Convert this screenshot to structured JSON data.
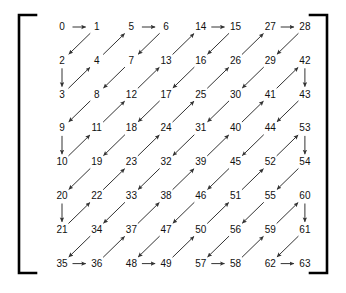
{
  "figure": {
    "type": "zigzag-scan-order-diagram",
    "grid_rows": 8,
    "grid_cols": 8,
    "bracket_color": "#000000",
    "arrow_color": "#333333",
    "text_color": "#111111",
    "background_color": "#ffffff"
  },
  "chart_data": {
    "type": "table",
    "title": "",
    "xlabel": "",
    "ylabel": "",
    "grid": false,
    "legend": "none",
    "rows": [
      [
        0,
        1,
        5,
        6,
        14,
        15,
        27,
        28
      ],
      [
        2,
        4,
        7,
        13,
        16,
        26,
        29,
        42
      ],
      [
        3,
        8,
        12,
        17,
        25,
        30,
        41,
        43
      ],
      [
        9,
        11,
        18,
        24,
        31,
        40,
        44,
        53
      ],
      [
        10,
        19,
        23,
        32,
        39,
        45,
        52,
        54
      ],
      [
        20,
        22,
        33,
        38,
        46,
        51,
        55,
        60
      ],
      [
        21,
        34,
        37,
        47,
        50,
        56,
        59,
        61
      ],
      [
        35,
        36,
        48,
        49,
        57,
        58,
        62,
        63
      ]
    ],
    "sequence": [
      [
        0,
        0
      ],
      [
        0,
        1
      ],
      [
        1,
        0
      ],
      [
        2,
        0
      ],
      [
        1,
        1
      ],
      [
        0,
        2
      ],
      [
        0,
        3
      ],
      [
        1,
        2
      ],
      [
        2,
        1
      ],
      [
        3,
        0
      ],
      [
        4,
        0
      ],
      [
        3,
        1
      ],
      [
        2,
        2
      ],
      [
        1,
        3
      ],
      [
        0,
        4
      ],
      [
        0,
        5
      ],
      [
        1,
        4
      ],
      [
        2,
        3
      ],
      [
        3,
        2
      ],
      [
        4,
        1
      ],
      [
        5,
        0
      ],
      [
        6,
        0
      ],
      [
        5,
        1
      ],
      [
        4,
        2
      ],
      [
        3,
        3
      ],
      [
        2,
        4
      ],
      [
        1,
        5
      ],
      [
        0,
        6
      ],
      [
        0,
        7
      ],
      [
        1,
        6
      ],
      [
        2,
        5
      ],
      [
        3,
        4
      ],
      [
        4,
        3
      ],
      [
        5,
        2
      ],
      [
        6,
        1
      ],
      [
        7,
        0
      ],
      [
        7,
        1
      ],
      [
        6,
        2
      ],
      [
        5,
        3
      ],
      [
        4,
        4
      ],
      [
        3,
        5
      ],
      [
        2,
        6
      ],
      [
        1,
        7
      ],
      [
        2,
        7
      ],
      [
        3,
        6
      ],
      [
        4,
        5
      ],
      [
        5,
        4
      ],
      [
        6,
        3
      ],
      [
        7,
        2
      ],
      [
        7,
        3
      ],
      [
        6,
        4
      ],
      [
        5,
        5
      ],
      [
        4,
        6
      ],
      [
        3,
        7
      ],
      [
        4,
        7
      ],
      [
        5,
        6
      ],
      [
        6,
        5
      ],
      [
        7,
        4
      ],
      [
        7,
        5
      ],
      [
        6,
        6
      ],
      [
        5,
        7
      ],
      [
        6,
        7
      ],
      [
        7,
        6
      ],
      [
        7,
        7
      ]
    ]
  },
  "cells": [
    {
      "value": "0",
      "row": 0,
      "col": 0
    },
    {
      "value": "1",
      "row": 0,
      "col": 1
    },
    {
      "value": "5",
      "row": 0,
      "col": 2
    },
    {
      "value": "6",
      "row": 0,
      "col": 3
    },
    {
      "value": "14",
      "row": 0,
      "col": 4
    },
    {
      "value": "15",
      "row": 0,
      "col": 5
    },
    {
      "value": "27",
      "row": 0,
      "col": 6
    },
    {
      "value": "28",
      "row": 0,
      "col": 7
    },
    {
      "value": "2",
      "row": 1,
      "col": 0
    },
    {
      "value": "4",
      "row": 1,
      "col": 1
    },
    {
      "value": "7",
      "row": 1,
      "col": 2
    },
    {
      "value": "13",
      "row": 1,
      "col": 3
    },
    {
      "value": "16",
      "row": 1,
      "col": 4
    },
    {
      "value": "26",
      "row": 1,
      "col": 5
    },
    {
      "value": "29",
      "row": 1,
      "col": 6
    },
    {
      "value": "42",
      "row": 1,
      "col": 7
    },
    {
      "value": "3",
      "row": 2,
      "col": 0
    },
    {
      "value": "8",
      "row": 2,
      "col": 1
    },
    {
      "value": "12",
      "row": 2,
      "col": 2
    },
    {
      "value": "17",
      "row": 2,
      "col": 3
    },
    {
      "value": "25",
      "row": 2,
      "col": 4
    },
    {
      "value": "30",
      "row": 2,
      "col": 5
    },
    {
      "value": "41",
      "row": 2,
      "col": 6
    },
    {
      "value": "43",
      "row": 2,
      "col": 7
    },
    {
      "value": "9",
      "row": 3,
      "col": 0
    },
    {
      "value": "11",
      "row": 3,
      "col": 1
    },
    {
      "value": "18",
      "row": 3,
      "col": 2
    },
    {
      "value": "24",
      "row": 3,
      "col": 3
    },
    {
      "value": "31",
      "row": 3,
      "col": 4
    },
    {
      "value": "40",
      "row": 3,
      "col": 5
    },
    {
      "value": "44",
      "row": 3,
      "col": 6
    },
    {
      "value": "53",
      "row": 3,
      "col": 7
    },
    {
      "value": "10",
      "row": 4,
      "col": 0
    },
    {
      "value": "19",
      "row": 4,
      "col": 1
    },
    {
      "value": "23",
      "row": 4,
      "col": 2
    },
    {
      "value": "32",
      "row": 4,
      "col": 3
    },
    {
      "value": "39",
      "row": 4,
      "col": 4
    },
    {
      "value": "45",
      "row": 4,
      "col": 5
    },
    {
      "value": "52",
      "row": 4,
      "col": 6
    },
    {
      "value": "54",
      "row": 4,
      "col": 7
    },
    {
      "value": "20",
      "row": 5,
      "col": 0
    },
    {
      "value": "22",
      "row": 5,
      "col": 1
    },
    {
      "value": "33",
      "row": 5,
      "col": 2
    },
    {
      "value": "38",
      "row": 5,
      "col": 3
    },
    {
      "value": "46",
      "row": 5,
      "col": 4
    },
    {
      "value": "51",
      "row": 5,
      "col": 5
    },
    {
      "value": "55",
      "row": 5,
      "col": 6
    },
    {
      "value": "60",
      "row": 5,
      "col": 7
    },
    {
      "value": "21",
      "row": 6,
      "col": 0
    },
    {
      "value": "34",
      "row": 6,
      "col": 1
    },
    {
      "value": "37",
      "row": 6,
      "col": 2
    },
    {
      "value": "47",
      "row": 6,
      "col": 3
    },
    {
      "value": "50",
      "row": 6,
      "col": 4
    },
    {
      "value": "56",
      "row": 6,
      "col": 5
    },
    {
      "value": "59",
      "row": 6,
      "col": 6
    },
    {
      "value": "61",
      "row": 6,
      "col": 7
    },
    {
      "value": "35",
      "row": 7,
      "col": 0
    },
    {
      "value": "36",
      "row": 7,
      "col": 1
    },
    {
      "value": "48",
      "row": 7,
      "col": 2
    },
    {
      "value": "49",
      "row": 7,
      "col": 3
    },
    {
      "value": "57",
      "row": 7,
      "col": 4
    },
    {
      "value": "58",
      "row": 7,
      "col": 5
    },
    {
      "value": "62",
      "row": 7,
      "col": 6
    },
    {
      "value": "63",
      "row": 7,
      "col": 7
    }
  ],
  "layout": {
    "origin_x": 62,
    "origin_y": 27,
    "step_x": 34.7,
    "step_y": 33.8,
    "bracket_left_x": 19,
    "bracket_right_x": 327,
    "bracket_top_y": 15,
    "bracket_bottom_y": 273,
    "bracket_arm": 17,
    "bracket_width": 2.6
  }
}
